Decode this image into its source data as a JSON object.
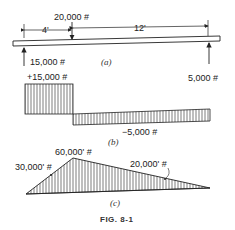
{
  "figure": {
    "caption": "FIG. 8-1",
    "panels": {
      "a": {
        "label": "(a)",
        "title": "Loaded beam",
        "dimensions": {
          "left_span": "4'",
          "right_span": "12'"
        },
        "point_load": "20,000 #",
        "left_reaction": "15,000 #",
        "right_reaction": "5,000 #"
      },
      "b": {
        "label": "(b)",
        "title": "Shear diagram",
        "positive_shear": "+15,000 #",
        "negative_shear": "−5,000 #"
      },
      "c": {
        "label": "(c)",
        "title": "Moment diagram",
        "max_moment": "60,000' #",
        "left_mid_moment": "30,000' #",
        "right_mid_moment": "20,000' #"
      }
    }
  },
  "colors": {
    "ink": "#222222",
    "hatch": "#444444",
    "background": "#ffffff"
  }
}
